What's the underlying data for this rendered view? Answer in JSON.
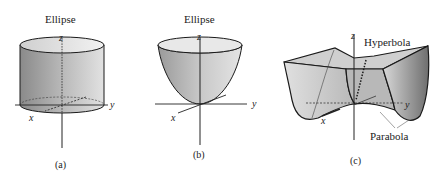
{
  "figure": {
    "panels": [
      {
        "id": "a",
        "surface": "elliptic-cylinder",
        "top_label": "Ellipse",
        "caption": "(a)",
        "axes": {
          "x": "x",
          "y": "y",
          "z": "z"
        }
      },
      {
        "id": "b",
        "surface": "elliptic-paraboloid",
        "top_label": "Ellipse",
        "caption": "(b)",
        "axes": {
          "x": "x",
          "y": "y",
          "z": "z"
        }
      },
      {
        "id": "c",
        "surface": "hyperbolic-paraboloid",
        "top_label": "Hyperbola",
        "side_label": "Parabola",
        "caption": "(c)",
        "axes": {
          "x": "x",
          "y": "y",
          "z": "z"
        }
      }
    ],
    "colors": {
      "surface_light": "#e6e6e6",
      "surface_dark": "#8c8c8c",
      "stroke": "#1a1a1a",
      "background": "#ffffff"
    }
  }
}
